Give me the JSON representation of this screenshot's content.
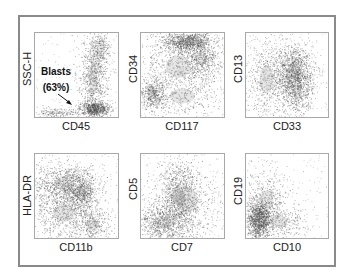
{
  "chart_data": [
    {
      "type": "scatter",
      "title": "",
      "xlabel": "CD45",
      "ylabel": "SSC-H",
      "grid": false,
      "annotations": [
        {
          "text": "Blasts",
          "subtext": "(63%)",
          "arrow": true
        }
      ],
      "clusters": [
        {
          "cx": 0.72,
          "cy": 0.9,
          "sx": 0.09,
          "sy": 0.04,
          "n": 650,
          "note": "blast gate (dense)"
        },
        {
          "cx": 0.7,
          "cy": 0.55,
          "sx": 0.09,
          "sy": 0.3,
          "n": 900
        },
        {
          "cx": 0.78,
          "cy": 0.2,
          "sx": 0.06,
          "sy": 0.15,
          "n": 250
        },
        {
          "cx": 0.25,
          "cy": 0.95,
          "sx": 0.15,
          "sy": 0.03,
          "n": 180
        }
      ]
    },
    {
      "type": "scatter",
      "xlabel": "CD117",
      "ylabel": "CD34",
      "grid": false,
      "clusters": [
        {
          "cx": 0.55,
          "cy": 0.1,
          "sx": 0.15,
          "sy": 0.06,
          "n": 900
        },
        {
          "cx": 0.72,
          "cy": 0.3,
          "sx": 0.12,
          "sy": 0.12,
          "n": 500
        },
        {
          "cx": 0.45,
          "cy": 0.4,
          "sx": 0.25,
          "sy": 0.22,
          "n": 700
        },
        {
          "cx": 0.14,
          "cy": 0.73,
          "sx": 0.08,
          "sy": 0.09,
          "n": 450
        },
        {
          "cx": 0.5,
          "cy": 0.75,
          "sx": 0.25,
          "sy": 0.15,
          "n": 300
        }
      ]
    },
    {
      "type": "scatter",
      "xlabel": "CD33",
      "ylabel": "CD13",
      "grid": false,
      "clusters": [
        {
          "cx": 0.58,
          "cy": 0.45,
          "sx": 0.12,
          "sy": 0.16,
          "n": 1100
        },
        {
          "cx": 0.62,
          "cy": 0.7,
          "sx": 0.1,
          "sy": 0.15,
          "n": 500
        },
        {
          "cx": 0.25,
          "cy": 0.55,
          "sx": 0.14,
          "sy": 0.28,
          "n": 600
        }
      ]
    },
    {
      "type": "scatter",
      "xlabel": "CD11b",
      "ylabel": "HLA-DR",
      "grid": false,
      "clusters": [
        {
          "cx": 0.35,
          "cy": 0.35,
          "sx": 0.2,
          "sy": 0.13,
          "n": 900
        },
        {
          "cx": 0.55,
          "cy": 0.48,
          "sx": 0.1,
          "sy": 0.12,
          "n": 550
        },
        {
          "cx": 0.35,
          "cy": 0.7,
          "sx": 0.22,
          "sy": 0.18,
          "n": 700
        },
        {
          "cx": 0.7,
          "cy": 0.85,
          "sx": 0.12,
          "sy": 0.1,
          "n": 300
        }
      ]
    },
    {
      "type": "scatter",
      "xlabel": "CD7",
      "ylabel": "CD5",
      "grid": false,
      "clusters": [
        {
          "cx": 0.45,
          "cy": 0.5,
          "sx": 0.12,
          "sy": 0.2,
          "n": 900
        },
        {
          "cx": 0.25,
          "cy": 0.82,
          "sx": 0.18,
          "sy": 0.12,
          "n": 800
        },
        {
          "cx": 0.55,
          "cy": 0.55,
          "sx": 0.22,
          "sy": 0.25,
          "n": 500
        }
      ]
    },
    {
      "type": "scatter",
      "xlabel": "CD10",
      "ylabel": "CD19",
      "grid": false,
      "clusters": [
        {
          "cx": 0.15,
          "cy": 0.78,
          "sx": 0.07,
          "sy": 0.12,
          "n": 1100
        },
        {
          "cx": 0.25,
          "cy": 0.55,
          "sx": 0.14,
          "sy": 0.2,
          "n": 450
        },
        {
          "cx": 0.4,
          "cy": 0.8,
          "sx": 0.18,
          "sy": 0.12,
          "n": 350
        }
      ]
    }
  ],
  "panels": [
    {
      "xlabel": "CD45",
      "ylabel": "SSC-H"
    },
    {
      "xlabel": "CD117",
      "ylabel": "CD34"
    },
    {
      "xlabel": "CD33",
      "ylabel": "CD13"
    },
    {
      "xlabel": "CD11b",
      "ylabel": "HLA-DR"
    },
    {
      "xlabel": "CD7",
      "ylabel": "CD5"
    },
    {
      "xlabel": "CD10",
      "ylabel": "CD19"
    }
  ],
  "annotation": {
    "line1": "Blasts",
    "line2": "(63%)"
  },
  "colors": {
    "dot": "#4a4a4a",
    "frame": "#8a8a8a",
    "axis": "#a8a8a8"
  }
}
